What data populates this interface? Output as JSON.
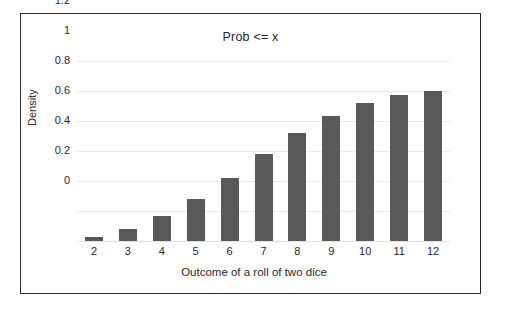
{
  "chart_data": {
    "type": "bar",
    "title": "Prob <= x",
    "xlabel": "Outcome of a roll of two dice",
    "ylabel": "Density",
    "categories": [
      "2",
      "3",
      "4",
      "5",
      "6",
      "7",
      "8",
      "9",
      "10",
      "11",
      "12"
    ],
    "values": [
      0.028,
      0.083,
      0.167,
      0.278,
      0.417,
      0.583,
      0.722,
      0.833,
      0.917,
      0.972,
      1.0
    ],
    "ylim": [
      0,
      1.2
    ],
    "yticks": [
      "0",
      "0.2",
      "0.4",
      "0.6",
      "0.8",
      "1",
      "1.2"
    ],
    "ytick_values": [
      0,
      0.2,
      0.4,
      0.6,
      0.8,
      1,
      1.2
    ],
    "grid": true,
    "legend": null,
    "bar_color": "#595959",
    "grid_color": "#e9e9e9",
    "frame_color": "#2b2b2b"
  }
}
